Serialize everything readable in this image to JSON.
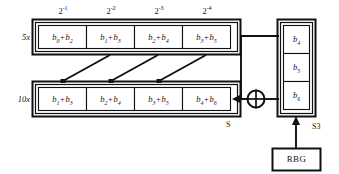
{
  "diagram": {
    "colors": {
      "background": "#ffffff",
      "stroke": "#111111",
      "text": "#141414",
      "cell_fill": "#ffffff"
    },
    "weight_labels": [
      {
        "base": "2",
        "exponent": "-1",
        "text": "2-1"
      },
      {
        "base": "2",
        "exponent": "-2",
        "text": "2-2"
      },
      {
        "base": "2",
        "exponent": "-3",
        "text": "2-3"
      },
      {
        "base": "2",
        "exponent": "-4",
        "text": "2-4"
      }
    ],
    "row_labels": {
      "top": "5x",
      "bottom": "10x"
    },
    "top_register": {
      "name": "5x register",
      "cells": [
        {
          "a": "b",
          "a_sub": "0",
          "op": "+",
          "b": "b",
          "b_sub": "2",
          "text": "b0 + b2"
        },
        {
          "a": "b",
          "a_sub": "1",
          "op": "+",
          "b": "b",
          "b_sub": "3",
          "text": "b1 + b3"
        },
        {
          "a": "b",
          "a_sub": "2",
          "op": "+",
          "b": "b",
          "b_sub": "4",
          "text": "b2 + b4"
        },
        {
          "a": "b",
          "a_sub": "3",
          "op": "+",
          "b": "b",
          "b_sub": "5",
          "text": "b3 + b5"
        }
      ]
    },
    "bottom_register": {
      "name": "10x register",
      "cells": [
        {
          "a": "b",
          "a_sub": "1",
          "op": "+",
          "b": "b",
          "b_sub": "3",
          "text": "b1 + b3"
        },
        {
          "a": "b",
          "a_sub": "2",
          "op": "+",
          "b": "b",
          "b_sub": "4",
          "text": "b2 + b4"
        },
        {
          "a": "b",
          "a_sub": "3",
          "op": "+",
          "b": "b",
          "b_sub": "5",
          "text": "b3 + b5"
        },
        {
          "a": "b",
          "a_sub": "4",
          "op": "+",
          "b": "b",
          "b_sub": "6",
          "text": "b4 + b6"
        }
      ]
    },
    "side_register": {
      "name": "S3 register",
      "cells": [
        {
          "a": "b",
          "a_sub": "4",
          "text": "b4"
        },
        {
          "a": "b",
          "a_sub": "5",
          "text": "b5"
        },
        {
          "a": "b",
          "a_sub": "6",
          "text": "b6"
        }
      ]
    },
    "xor_gate": {
      "name": "xor-gate",
      "symbol": "+"
    },
    "node_labels": {
      "sum_output": "S",
      "side_register": "S3"
    },
    "rbg_block": {
      "label": "RBG"
    }
  }
}
